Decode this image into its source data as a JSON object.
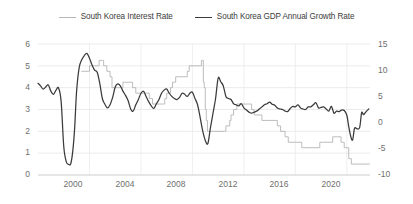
{
  "legend": {
    "position": "top-center",
    "entries": [
      {
        "label": "South Korea Interest Rate",
        "color": "#b6b6b6",
        "icon": "line-swatch-icon"
      },
      {
        "label": "South Korea GDP Annual Growth Rate",
        "color": "#3a3a3a",
        "icon": "line-swatch-icon"
      }
    ]
  },
  "axes": {
    "y_left": {
      "ticks": [
        "0",
        "1",
        "2",
        "3",
        "4",
        "5",
        "6"
      ],
      "min": 0,
      "max": 6
    },
    "y_right": {
      "ticks": [
        "-10",
        "-5",
        "0",
        "5",
        "10",
        "15"
      ],
      "min": -10,
      "max": 15
    },
    "x": {
      "ticks": [
        "2000",
        "2004",
        "2008",
        "2012",
        "2016",
        "2020"
      ],
      "min": 1996.0,
      "max": 2021.8
    }
  },
  "chart_data": {
    "type": "line",
    "title": "",
    "subtitle": "",
    "xlabel": "",
    "ylabel": "",
    "grid": true,
    "legend_position": "top-center",
    "xlim": [
      1996.0,
      2021.8
    ],
    "ylim_left": [
      0,
      6
    ],
    "ylim_right": [
      -10,
      15
    ],
    "series": [
      {
        "name": "South Korea Interest Rate",
        "axis": "left",
        "color": "#b6b6b6",
        "unit": "percent",
        "style": "step",
        "points": [
          [
            1999.4,
            4.75
          ],
          [
            1999.9,
            4.75
          ],
          [
            2000.0,
            5.0
          ],
          [
            2000.15,
            5.0
          ],
          [
            2000.3,
            5.0
          ],
          [
            2000.75,
            5.25
          ],
          [
            2001.0,
            5.25
          ],
          [
            2001.1,
            5.0
          ],
          [
            2001.35,
            4.75
          ],
          [
            2001.6,
            4.5
          ],
          [
            2001.75,
            4.0
          ],
          [
            2002.3,
            4.0
          ],
          [
            2002.6,
            4.25
          ],
          [
            2003.0,
            4.25
          ],
          [
            2003.35,
            4.0
          ],
          [
            2003.6,
            3.75
          ],
          [
            2004.3,
            3.75
          ],
          [
            2004.65,
            3.5
          ],
          [
            2004.9,
            3.25
          ],
          [
            2005.75,
            3.25
          ],
          [
            2005.85,
            3.5
          ],
          [
            2006.0,
            3.75
          ],
          [
            2006.3,
            4.0
          ],
          [
            2006.45,
            4.25
          ],
          [
            2006.7,
            4.5
          ],
          [
            2007.35,
            4.5
          ],
          [
            2007.6,
            4.75
          ],
          [
            2007.75,
            5.0
          ],
          [
            2008.6,
            5.0
          ],
          [
            2008.7,
            5.25
          ],
          [
            2008.78,
            5.25
          ],
          [
            2008.85,
            4.25
          ],
          [
            2008.92,
            4.0
          ],
          [
            2009.0,
            3.0
          ],
          [
            2009.08,
            2.5
          ],
          [
            2009.17,
            2.0
          ],
          [
            2010.5,
            2.0
          ],
          [
            2010.6,
            2.25
          ],
          [
            2010.9,
            2.5
          ],
          [
            2011.0,
            2.75
          ],
          [
            2011.2,
            3.0
          ],
          [
            2011.45,
            3.25
          ],
          [
            2012.5,
            3.25
          ],
          [
            2012.6,
            3.0
          ],
          [
            2012.8,
            2.75
          ],
          [
            2013.4,
            2.5
          ],
          [
            2014.6,
            2.25
          ],
          [
            2014.85,
            2.0
          ],
          [
            2015.2,
            1.75
          ],
          [
            2015.45,
            1.5
          ],
          [
            2016.5,
            1.25
          ],
          [
            2017.9,
            1.5
          ],
          [
            2018.9,
            1.75
          ],
          [
            2019.55,
            1.5
          ],
          [
            2019.8,
            1.25
          ],
          [
            2020.15,
            0.75
          ],
          [
            2020.35,
            0.5
          ],
          [
            2021.75,
            0.5
          ]
        ]
      },
      {
        "name": "South Korea GDP Annual Growth Rate",
        "axis": "right",
        "color": "#3a3a3a",
        "unit": "percent",
        "style": "line",
        "points": [
          [
            1996.0,
            7.5
          ],
          [
            1996.2,
            7.0
          ],
          [
            1996.4,
            6.4
          ],
          [
            1996.6,
            6.8
          ],
          [
            1996.8,
            7.2
          ],
          [
            1997.0,
            6.0
          ],
          [
            1997.2,
            5.4
          ],
          [
            1997.4,
            6.2
          ],
          [
            1997.6,
            6.6
          ],
          [
            1997.8,
            4.0
          ],
          [
            1998.0,
            -4.5
          ],
          [
            1998.2,
            -7.5
          ],
          [
            1998.4,
            -8.0
          ],
          [
            1998.55,
            -7.8
          ],
          [
            1998.7,
            -5.5
          ],
          [
            1998.85,
            -1.0
          ],
          [
            1999.0,
            6.0
          ],
          [
            1999.2,
            10.5
          ],
          [
            1999.4,
            12.0
          ],
          [
            1999.6,
            12.8
          ],
          [
            1999.8,
            13.2
          ],
          [
            2000.0,
            12.3
          ],
          [
            2000.2,
            11.0
          ],
          [
            2000.4,
            10.0
          ],
          [
            2000.6,
            9.6
          ],
          [
            2000.8,
            7.5
          ],
          [
            2001.0,
            4.6
          ],
          [
            2001.2,
            3.5
          ],
          [
            2001.4,
            2.8
          ],
          [
            2001.6,
            3.4
          ],
          [
            2001.8,
            4.8
          ],
          [
            2002.0,
            6.8
          ],
          [
            2002.2,
            7.4
          ],
          [
            2002.4,
            7.0
          ],
          [
            2002.6,
            6.0
          ],
          [
            2002.8,
            5.2
          ],
          [
            2003.0,
            4.2
          ],
          [
            2003.2,
            2.6
          ],
          [
            2003.4,
            2.2
          ],
          [
            2003.6,
            3.4
          ],
          [
            2003.8,
            4.4
          ],
          [
            2004.0,
            5.6
          ],
          [
            2004.2,
            6.0
          ],
          [
            2004.4,
            5.0
          ],
          [
            2004.6,
            4.0
          ],
          [
            2004.8,
            3.2
          ],
          [
            2005.0,
            2.7
          ],
          [
            2005.2,
            3.6
          ],
          [
            2005.4,
            4.4
          ],
          [
            2005.6,
            5.6
          ],
          [
            2005.8,
            6.2
          ],
          [
            2006.0,
            6.4
          ],
          [
            2006.2,
            5.6
          ],
          [
            2006.4,
            5.0
          ],
          [
            2006.6,
            4.6
          ],
          [
            2006.8,
            4.4
          ],
          [
            2007.0,
            4.8
          ],
          [
            2007.2,
            5.6
          ],
          [
            2007.4,
            5.4
          ],
          [
            2007.6,
            5.0
          ],
          [
            2007.8,
            5.6
          ],
          [
            2008.0,
            5.8
          ],
          [
            2008.2,
            4.6
          ],
          [
            2008.4,
            3.4
          ],
          [
            2008.6,
            1.0
          ],
          [
            2008.8,
            -1.6
          ],
          [
            2009.0,
            -3.4
          ],
          [
            2009.2,
            -4.0
          ],
          [
            2009.4,
            -1.0
          ],
          [
            2009.6,
            1.8
          ],
          [
            2009.8,
            4.6
          ],
          [
            2010.0,
            8.5
          ],
          [
            2010.2,
            7.8
          ],
          [
            2010.4,
            7.0
          ],
          [
            2010.6,
            5.0
          ],
          [
            2010.8,
            4.6
          ],
          [
            2011.0,
            4.4
          ],
          [
            2011.2,
            3.6
          ],
          [
            2011.4,
            3.4
          ],
          [
            2011.6,
            3.2
          ],
          [
            2011.8,
            3.6
          ],
          [
            2012.0,
            2.8
          ],
          [
            2012.2,
            2.4
          ],
          [
            2012.4,
            2.0
          ],
          [
            2012.6,
            1.8
          ],
          [
            2012.8,
            2.0
          ],
          [
            2013.0,
            2.2
          ],
          [
            2013.2,
            2.6
          ],
          [
            2013.4,
            3.0
          ],
          [
            2013.6,
            3.4
          ],
          [
            2013.8,
            3.6
          ],
          [
            2014.0,
            3.9
          ],
          [
            2014.2,
            3.5
          ],
          [
            2014.4,
            3.3
          ],
          [
            2014.6,
            2.8
          ],
          [
            2014.8,
            2.6
          ],
          [
            2015.0,
            2.5
          ],
          [
            2015.2,
            2.2
          ],
          [
            2015.4,
            2.1
          ],
          [
            2015.6,
            2.7
          ],
          [
            2015.8,
            3.1
          ],
          [
            2016.0,
            3.0
          ],
          [
            2016.2,
            3.4
          ],
          [
            2016.4,
            2.8
          ],
          [
            2016.6,
            2.6
          ],
          [
            2016.8,
            2.5
          ],
          [
            2017.0,
            3.0
          ],
          [
            2017.2,
            3.0
          ],
          [
            2017.4,
            3.4
          ],
          [
            2017.6,
            3.8
          ],
          [
            2017.8,
            2.8
          ],
          [
            2018.0,
            2.9
          ],
          [
            2018.2,
            3.0
          ],
          [
            2018.4,
            2.6
          ],
          [
            2018.6,
            2.2
          ],
          [
            2018.8,
            3.1
          ],
          [
            2019.0,
            1.8
          ],
          [
            2019.2,
            2.2
          ],
          [
            2019.4,
            2.1
          ],
          [
            2019.6,
            2.4
          ],
          [
            2019.8,
            2.3
          ],
          [
            2020.0,
            1.4
          ],
          [
            2020.15,
            -0.8
          ],
          [
            2020.3,
            -2.6
          ],
          [
            2020.45,
            -3.3
          ],
          [
            2020.6,
            -1.1
          ],
          [
            2020.8,
            -1.2
          ],
          [
            2021.0,
            -0.9
          ],
          [
            2021.15,
            1.9
          ],
          [
            2021.3,
            1.5
          ],
          [
            2021.5,
            2.1
          ],
          [
            2021.7,
            2.6
          ]
        ]
      }
    ]
  }
}
